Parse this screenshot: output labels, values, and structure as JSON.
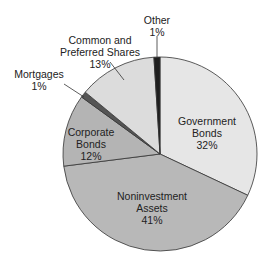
{
  "chart_data": {
    "type": "pie",
    "title": "",
    "categories": [
      "Government Bonds",
      "Noninvestment Assets",
      "Corporate Bonds",
      "Mortgages",
      "Common and Preferred Shares",
      "Other"
    ],
    "values": [
      32,
      41,
      12,
      1,
      13,
      1
    ],
    "unit": "%",
    "colors": [
      "#e6e6e6",
      "#b8b8b8",
      "#b4b4b4",
      "#555555",
      "#dcdcdc",
      "#1e1e1e"
    ],
    "start_angle_deg": 0,
    "direction": "clockwise",
    "legend": "none (direct labels)"
  },
  "labels": {
    "government": {
      "line1": "Government",
      "line2": "Bonds",
      "pct": "32%"
    },
    "noninvestment": {
      "line1": "Noninvestment",
      "line2": "Assets",
      "pct": "41%"
    },
    "corporate": {
      "line1": "Corporate",
      "line2": "Bonds",
      "pct": "12%"
    },
    "mortgages": {
      "line1": "Mortgages",
      "pct": "1%"
    },
    "shares": {
      "line1": "Common and",
      "line2": "Preferred Shares",
      "pct": "13%"
    },
    "other": {
      "line1": "Other",
      "pct": "1%"
    }
  }
}
